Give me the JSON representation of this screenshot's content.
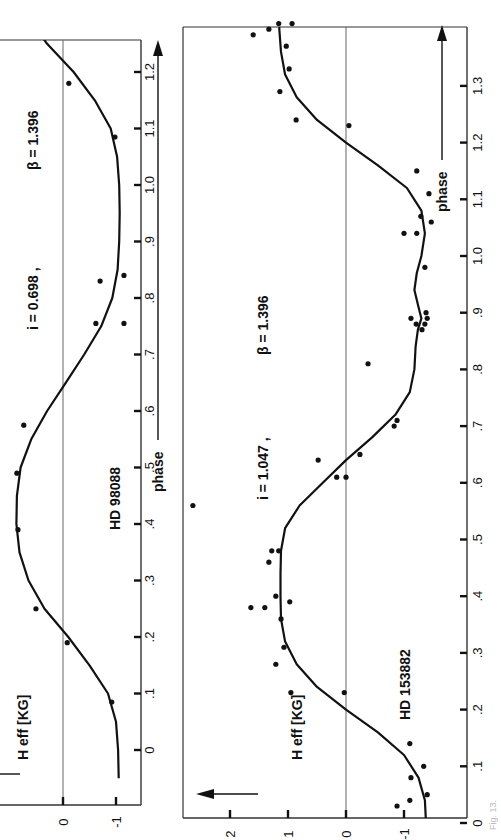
{
  "figure": {
    "orientation": "rotated 90deg counter-clockwise (phase axis runs bottom-to-top)",
    "caption_fragment": "Fig. 13."
  },
  "chart_data": [
    {
      "type": "scatter",
      "title": "HD 98088",
      "annotation": "i = 0.698 , β = 1.396",
      "xlabel": "phase",
      "ylabel": "H_eff [KG]",
      "xlim": [
        -0.05,
        1.27
      ],
      "ylim": [
        -1.15,
        1.0
      ],
      "xticks": [
        "0",
        ".1",
        ".2",
        ".3",
        ".4",
        ".5",
        ".6",
        ".7",
        ".8",
        ".9",
        "1.0",
        "1.1",
        "1.2"
      ],
      "xtick_values": [
        0,
        0.1,
        0.2,
        0.3,
        0.4,
        0.5,
        0.6,
        0.7,
        0.8,
        0.9,
        1.0,
        1.1,
        1.2
      ],
      "yticks": [
        "0",
        "-1"
      ],
      "ytick_values": [
        0,
        -1
      ],
      "zero_line": true,
      "points": [
        [
          0.085,
          -0.92
        ],
        [
          0.19,
          -0.08
        ],
        [
          0.25,
          0.51
        ],
        [
          0.39,
          0.85
        ],
        [
          0.49,
          0.87
        ],
        [
          0.575,
          0.74
        ],
        [
          0.755,
          -0.62
        ],
        [
          0.755,
          -1.15
        ],
        [
          0.83,
          -0.7
        ],
        [
          0.84,
          -1.15
        ],
        [
          1.085,
          -0.98
        ],
        [
          1.18,
          -0.11
        ]
      ],
      "fit_curve": [
        [
          -0.05,
          -1.05
        ],
        [
          0.0,
          -1.04
        ],
        [
          0.05,
          -1.0
        ],
        [
          0.1,
          -0.85
        ],
        [
          0.15,
          -0.5
        ],
        [
          0.2,
          -0.1
        ],
        [
          0.25,
          0.35
        ],
        [
          0.3,
          0.65
        ],
        [
          0.35,
          0.82
        ],
        [
          0.4,
          0.88
        ],
        [
          0.45,
          0.87
        ],
        [
          0.5,
          0.8
        ],
        [
          0.55,
          0.6
        ],
        [
          0.6,
          0.3
        ],
        [
          0.65,
          -0.05
        ],
        [
          0.7,
          -0.4
        ],
        [
          0.75,
          -0.72
        ],
        [
          0.8,
          -0.93
        ],
        [
          0.85,
          -1.03
        ],
        [
          0.9,
          -1.06
        ],
        [
          0.95,
          -1.07
        ],
        [
          1.0,
          -1.06
        ],
        [
          1.05,
          -1.02
        ],
        [
          1.1,
          -0.9
        ],
        [
          1.15,
          -0.6
        ],
        [
          1.2,
          -0.2
        ],
        [
          1.25,
          0.3
        ],
        [
          1.27,
          0.45
        ]
      ]
    },
    {
      "type": "scatter",
      "title": "HD 153882",
      "annotation": "i = 1.047 , β = 1.396",
      "xlabel": "phase",
      "ylabel": "H_eff [KG]",
      "xlim": [
        -0.01,
        1.42
      ],
      "ylim": [
        -1.95,
        2.8
      ],
      "xticks": [
        "0",
        ".1",
        ".2",
        ".3",
        ".4",
        ".5",
        ".6",
        ".7",
        ".8",
        ".9",
        "1.0",
        "1.1",
        "1.2",
        "1.3"
      ],
      "xtick_values": [
        0,
        0.1,
        0.2,
        0.3,
        0.4,
        0.5,
        0.6,
        0.7,
        0.8,
        0.9,
        1.0,
        1.1,
        1.2,
        1.3
      ],
      "yticks": [
        "2",
        "1",
        "0",
        "-1"
      ],
      "ytick_values": [
        2,
        1,
        0,
        -1
      ],
      "zero_line": true,
      "points": [
        [
          0.03,
          -0.88
        ],
        [
          0.04,
          -1.1
        ],
        [
          0.05,
          -1.4
        ],
        [
          0.08,
          -1.12
        ],
        [
          0.1,
          -1.34
        ],
        [
          0.14,
          -1.1
        ],
        [
          0.23,
          0.95
        ],
        [
          0.23,
          0.03
        ],
        [
          0.28,
          1.21
        ],
        [
          0.31,
          1.07
        ],
        [
          0.36,
          1.12
        ],
        [
          0.38,
          1.4
        ],
        [
          0.38,
          1.64
        ],
        [
          0.39,
          0.97
        ],
        [
          0.4,
          1.21
        ],
        [
          0.46,
          1.33
        ],
        [
          0.48,
          1.28
        ],
        [
          0.48,
          1.16
        ],
        [
          0.56,
          2.64
        ],
        [
          0.61,
          0.0
        ],
        [
          0.61,
          0.16
        ],
        [
          0.64,
          0.48
        ],
        [
          0.65,
          -0.24
        ],
        [
          0.7,
          -0.83
        ],
        [
          0.71,
          -0.88
        ],
        [
          0.81,
          -0.38
        ],
        [
          0.87,
          -1.31
        ],
        [
          0.88,
          -1.21
        ],
        [
          0.88,
          -1.36
        ],
        [
          0.89,
          -1.12
        ],
        [
          0.89,
          -1.4
        ],
        [
          0.9,
          -1.38
        ],
        [
          0.98,
          -1.36
        ],
        [
          1.04,
          -1.0
        ],
        [
          1.04,
          -1.22
        ],
        [
          1.06,
          -1.47
        ],
        [
          1.07,
          -1.29
        ],
        [
          1.11,
          -1.43
        ],
        [
          1.15,
          -1.22
        ],
        [
          1.23,
          -0.05
        ],
        [
          1.24,
          0.86
        ],
        [
          1.29,
          1.14
        ],
        [
          1.33,
          0.98
        ],
        [
          1.37,
          1.03
        ],
        [
          1.39,
          1.6
        ],
        [
          1.4,
          1.33
        ],
        [
          1.41,
          1.16
        ],
        [
          1.41,
          0.93
        ]
      ],
      "fit_curve": [
        [
          0.0,
          -1.38
        ],
        [
          0.04,
          -1.36
        ],
        [
          0.08,
          -1.25
        ],
        [
          0.12,
          -1.0
        ],
        [
          0.16,
          -0.55
        ],
        [
          0.2,
          0.0
        ],
        [
          0.24,
          0.5
        ],
        [
          0.28,
          0.85
        ],
        [
          0.32,
          1.05
        ],
        [
          0.36,
          1.12
        ],
        [
          0.4,
          1.13
        ],
        [
          0.44,
          1.13
        ],
        [
          0.48,
          1.12
        ],
        [
          0.52,
          1.05
        ],
        [
          0.56,
          0.8
        ],
        [
          0.6,
          0.4
        ],
        [
          0.64,
          0.0
        ],
        [
          0.68,
          -0.45
        ],
        [
          0.72,
          -0.85
        ],
        [
          0.76,
          -1.1
        ],
        [
          0.8,
          -1.18
        ],
        [
          0.84,
          -1.2
        ],
        [
          0.87,
          -1.24
        ],
        [
          0.89,
          -1.3
        ],
        [
          0.91,
          -1.25
        ],
        [
          0.94,
          -1.18
        ],
        [
          0.97,
          -1.22
        ],
        [
          1.0,
          -1.3
        ],
        [
          1.04,
          -1.36
        ],
        [
          1.08,
          -1.3
        ],
        [
          1.12,
          -1.05
        ],
        [
          1.16,
          -0.55
        ],
        [
          1.2,
          0.0
        ],
        [
          1.24,
          0.5
        ],
        [
          1.28,
          0.85
        ],
        [
          1.32,
          1.05
        ],
        [
          1.36,
          1.12
        ],
        [
          1.4,
          1.15
        ],
        [
          1.42,
          1.15
        ]
      ]
    }
  ],
  "colors": {
    "ink": "#111111",
    "frame": "#333333",
    "zero_line": "#666666",
    "background": "#ffffff"
  }
}
